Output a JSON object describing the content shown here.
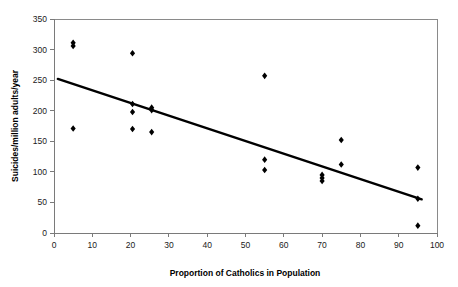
{
  "chart_data": {
    "type": "scatter",
    "title": "",
    "xlabel": "Proportion of Catholics in Population",
    "ylabel": "Suicides/million adults/year",
    "xlim": [
      0,
      100
    ],
    "ylim": [
      0,
      350
    ],
    "xticks": [
      0,
      10,
      20,
      30,
      40,
      50,
      60,
      70,
      80,
      90,
      100
    ],
    "yticks": [
      0,
      50,
      100,
      150,
      200,
      250,
      300,
      350
    ],
    "grid": false,
    "legend": null,
    "marker_shape": "diamond",
    "marker_color": "#000000",
    "points": [
      {
        "x": 5,
        "y": 311
      },
      {
        "x": 5,
        "y": 306
      },
      {
        "x": 5,
        "y": 171
      },
      {
        "x": 20.5,
        "y": 294
      },
      {
        "x": 20.5,
        "y": 211
      },
      {
        "x": 20.5,
        "y": 198
      },
      {
        "x": 20.5,
        "y": 170
      },
      {
        "x": 25.5,
        "y": 205
      },
      {
        "x": 25.5,
        "y": 201
      },
      {
        "x": 25.5,
        "y": 165
      },
      {
        "x": 55,
        "y": 257
      },
      {
        "x": 55,
        "y": 120
      },
      {
        "x": 55,
        "y": 103
      },
      {
        "x": 70,
        "y": 95
      },
      {
        "x": 70,
        "y": 90
      },
      {
        "x": 70,
        "y": 85
      },
      {
        "x": 75,
        "y": 152
      },
      {
        "x": 75,
        "y": 112
      },
      {
        "x": 95,
        "y": 107
      },
      {
        "x": 95,
        "y": 56
      },
      {
        "x": 95,
        "y": 12
      }
    ],
    "trend_line": {
      "type": "linear",
      "start": {
        "x": 1,
        "y": 252
      },
      "end": {
        "x": 96,
        "y": 55
      },
      "color": "#000000"
    }
  }
}
